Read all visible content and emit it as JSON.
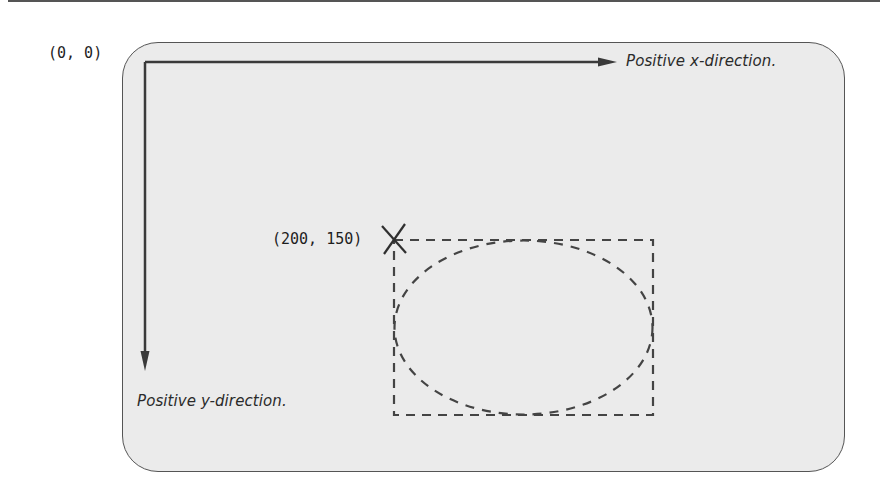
{
  "diagram": {
    "type": "coordinate-system",
    "origin_label": "(0, 0)",
    "point_label": "(200, 150)",
    "x_axis_label": "Positive x-direction.",
    "y_axis_label": "Positive y-direction.",
    "shapes": {
      "bounding_rectangle": {
        "style": "dashed",
        "top_left_label": "(200, 150)"
      },
      "ellipse": {
        "style": "dashed",
        "inscribed_in": "bounding_rectangle"
      },
      "marker": {
        "shape": "cross",
        "at": "(200, 150)"
      }
    },
    "colors": {
      "frame_fill": "#ebebeb",
      "frame_stroke": "#555555",
      "axis": "#3a3a3a",
      "dashes": "#444444",
      "text": "#1e1e1e"
    }
  }
}
